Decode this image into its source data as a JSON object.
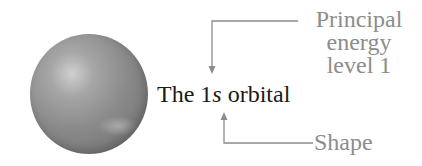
{
  "diagram": {
    "title": "The 1s orbital",
    "main_label": {
      "prefix": "The ",
      "number": "1",
      "letter": "s",
      "suffix": " orbital"
    },
    "annotations": [
      {
        "id": "principal",
        "lines": [
          "Principal",
          "energy",
          "level 1"
        ],
        "points_to": "1"
      },
      {
        "id": "shape",
        "lines": [
          "Shape"
        ],
        "points_to": "s"
      }
    ],
    "sphere": {
      "shape": "sphere",
      "color": "#8a8a8a"
    },
    "colors": {
      "label_text": "#1a1a1a",
      "annotation_text": "#8c8c8c",
      "arrow": "#8c8c8c"
    }
  }
}
